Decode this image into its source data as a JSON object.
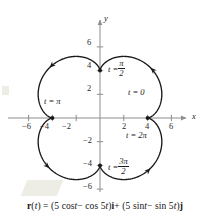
{
  "figure": {
    "caption_parts": [
      {
        "text": "r",
        "style": "bold"
      },
      {
        "text": "(",
        "style": "plain"
      },
      {
        "text": "t",
        "style": "italic"
      },
      {
        "text": ") = (5 cos ",
        "style": "plain"
      },
      {
        "text": "t",
        "style": "italic"
      },
      {
        "text": " − cos 5",
        "style": "plain"
      },
      {
        "text": "t",
        "style": "italic"
      },
      {
        "text": ")",
        "style": "plain"
      },
      {
        "text": "i",
        "style": "bold"
      },
      {
        "text": " + (5 sin ",
        "style": "plain"
      },
      {
        "text": "t",
        "style": "italic"
      },
      {
        "text": " − sin 5",
        "style": "plain"
      },
      {
        "text": "t",
        "style": "italic"
      },
      {
        "text": ")",
        "style": "plain"
      },
      {
        "text": "j",
        "style": "bold"
      }
    ],
    "caption_text": "r(t) = (5 cos t − cos 5t)i + (5 sin t − sin 5t)j",
    "axis_x_name": "x",
    "axis_y_name": "y",
    "curve_color": "#1a1a1a",
    "axis_color": "#8e8e8e"
  },
  "chart_data": {
    "type": "line",
    "title": "",
    "subtitle": "",
    "xlabel": "x",
    "ylabel": "y",
    "xlim": [
      -7.2,
      7.2
    ],
    "ylim": [
      -7.2,
      7.2
    ],
    "grid": false,
    "legend": "none",
    "parametric": {
      "x_expr": "5*cos(t) - cos(5*t)",
      "y_expr": "5*sin(t) - sin(5*t)",
      "t_range": [
        0,
        6.283185307179586
      ],
      "samples": 720,
      "description": "Epicycloid-like four-petal closed curve traced counterclockwise"
    },
    "x_ticks": [
      -6,
      -4,
      -2,
      2,
      4,
      6
    ],
    "x_tick_labels": [
      "−6",
      "−4",
      "−2",
      "2",
      "4",
      "6"
    ],
    "y_ticks": [
      -6,
      -4,
      -2,
      2,
      4,
      6
    ],
    "y_tick_labels": [
      "−6",
      "−4",
      "−2",
      "2",
      "4",
      "6"
    ],
    "marked_points": [
      {
        "t_label": "t = 0",
        "t_value": 0,
        "x": 4,
        "y": 0,
        "marker": false
      },
      {
        "t_label": "t = π/2",
        "t_value": 1.5708,
        "x": 0,
        "y": 4,
        "marker": true
      },
      {
        "t_label": "t = π",
        "t_value": 3.1416,
        "x": -4,
        "y": 0,
        "marker": true
      },
      {
        "t_label": "t = 3π/2",
        "t_value": 4.7124,
        "x": 0,
        "y": -4,
        "marker": true
      },
      {
        "t_label": "t = 2π",
        "t_value": 6.2832,
        "x": 4,
        "y": 0,
        "marker": true
      }
    ],
    "direction_arrows": [
      {
        "at_t": 0.785,
        "direction": "counterclockwise"
      },
      {
        "at_t": 2.356,
        "direction": "counterclockwise"
      },
      {
        "at_t": 3.927,
        "direction": "counterclockwise"
      },
      {
        "at_t": 5.498,
        "direction": "counterclockwise"
      }
    ],
    "cusps": [
      [
        4,
        0
      ],
      [
        0,
        4
      ],
      [
        -4,
        0
      ],
      [
        0,
        -4
      ]
    ],
    "petal_extent": 6
  },
  "labels": {
    "t0": "t = 0",
    "t_pi_over_2_prefix": "t =",
    "t_pi_over_2_num": "π",
    "t_pi_over_2_den": "2",
    "t_pi": "t = π",
    "t_3pi_over_2_prefix": "t =",
    "t_3pi_over_2_num": "3π",
    "t_3pi_over_2_den": "2",
    "t_2pi": "t = 2π",
    "x_axis": "x",
    "y_axis": "y",
    "xt_m6": "−6",
    "xt_m4": "−4",
    "xt_m2": "−2",
    "xt_2": "2",
    "xt_4": "4",
    "xt_6": "6",
    "yt_6": "6",
    "yt_4": "4",
    "yt_2": "2",
    "yt_m2": "−2",
    "yt_m4": "−4",
    "yt_m6": "−6"
  }
}
